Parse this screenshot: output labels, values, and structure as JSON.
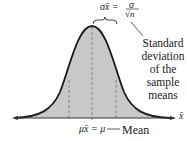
{
  "figure": {
    "type": "normal-distribution-diagram",
    "colors": {
      "curve": "#1a1a1a",
      "fill": "#c8c8c8",
      "dashed": "#7a7a7a",
      "axis": "#333333"
    },
    "formula": {
      "lhs": "σx̄ =",
      "num": "σ",
      "den": "√n"
    },
    "side_label_lines": [
      "Standard",
      "deviation",
      "of the",
      "sample",
      "means"
    ],
    "axis_label": "x̄",
    "mean_formula": "μx̄ = μ",
    "mean_label": "Mean"
  }
}
